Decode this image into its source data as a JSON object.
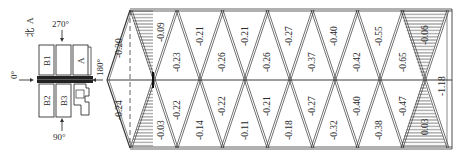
{
  "legend_block": {
    "north_label": "北",
    "north_sub": "A",
    "dir_270": "270°",
    "dir_0": "0°",
    "dir_90": "90°",
    "dir_180": "180°",
    "buildings": [
      "B1",
      "A",
      "B2",
      "B3"
    ]
  },
  "roof": {
    "apex_upper": "-0.20",
    "apex_lower": "-0.24",
    "upper_row": [
      "-0.09",
      "-0.23",
      "-0.21",
      "-0.26",
      "-0.21",
      "-0.26",
      "-0.27",
      "-0.37",
      "-0.40",
      "-0.42",
      "-0.55",
      "-0.65",
      "-0.06"
    ],
    "lower_row": [
      "-0.03",
      "-0.22",
      "-0.14",
      "-0.22",
      "-0.11",
      "-0.21",
      "-0.18",
      "-0.27",
      "-0.32",
      "-0.40",
      "-0.38",
      "-0.47",
      "0.03"
    ],
    "end_column": "-1.18"
  },
  "colors": {
    "line": "#3a3a3a",
    "hatch": "#555555",
    "background": "#ffffff"
  }
}
